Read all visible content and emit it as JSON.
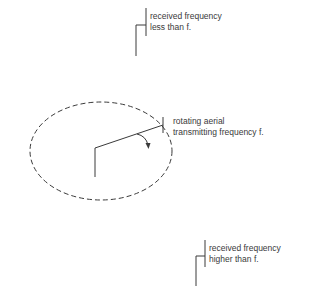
{
  "labels": {
    "top": [
      "received frequency",
      "less than f."
    ],
    "middle": [
      "rotating aerial",
      "transmitting frequency f."
    ],
    "bottom": [
      "received frequency",
      "higher than f."
    ]
  },
  "colors": {
    "line": "#3a3a3a",
    "background": "#ffffff"
  }
}
